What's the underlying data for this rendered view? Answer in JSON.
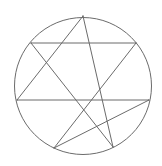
{
  "diagram": {
    "type": "heptagram-in-circle",
    "schlafli": "{7/2}",
    "stroke_color": "#6b6b6b",
    "background": "#ffffff",
    "circle": {
      "cx": 83,
      "cy": 86,
      "r": 68.5
    },
    "vertices": [
      {
        "id": "A",
        "x": 83,
        "y": 16
      },
      {
        "id": "B",
        "x": 136,
        "y": 43
      },
      {
        "id": "C",
        "x": 149,
        "y": 100
      },
      {
        "id": "D",
        "x": 113,
        "y": 147
      },
      {
        "id": "E",
        "x": 54,
        "y": 148
      },
      {
        "id": "F",
        "x": 17,
        "y": 100
      },
      {
        "id": "G",
        "x": 31,
        "y": 43
      }
    ],
    "edges": [
      [
        "A",
        "D"
      ],
      [
        "D",
        "G"
      ],
      [
        "G",
        "B"
      ],
      [
        "B",
        "E"
      ],
      [
        "E",
        "C"
      ],
      [
        "C",
        "F"
      ],
      [
        "F",
        "A"
      ]
    ]
  }
}
